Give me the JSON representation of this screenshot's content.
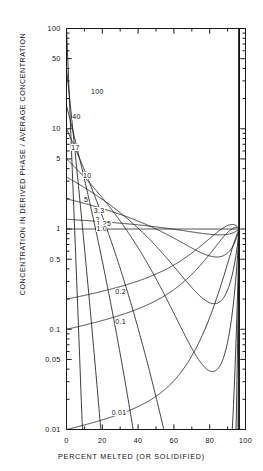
{
  "chart_data": {
    "type": "line",
    "title": "",
    "xlabel": "PERCENT MELTED (OR SOLIDIFIED)",
    "ylabel": "CONCENTRATION IN DERIVED PHASE / AVERAGE CONCENTRATION",
    "xscale": "linear",
    "yscale": "log",
    "xlim": [
      0,
      100
    ],
    "ylim": [
      0.01,
      100
    ],
    "grid": false,
    "legend": "inline-curve-labels",
    "xticks": [
      0,
      20,
      40,
      60,
      80,
      100
    ],
    "xtick_labels": [
      "0",
      "20",
      "40",
      "60",
      "80",
      "100"
    ],
    "x_minor_ticks": [
      10,
      30,
      50,
      70,
      90
    ],
    "yticks": [
      100,
      50,
      10,
      5,
      1,
      0.5,
      0.1,
      0.05,
      0.01
    ],
    "ytick_labels": [
      "100",
      "50",
      "10",
      "5",
      "1",
      "0.5",
      "0.1",
      "0.05",
      "0.01"
    ],
    "series": [
      {
        "name": "100",
        "k": 100,
        "label": "100",
        "label_x": 13.5,
        "label_y": 23.0
      },
      {
        "name": "40",
        "k": 40,
        "label": "40",
        "label_x": 3.0,
        "label_y": 13.0
      },
      {
        "name": "17",
        "k": 17,
        "label": "17",
        "label_x": 2.5,
        "label_y": 6.4
      },
      {
        "name": "10",
        "k": 10,
        "label": "10",
        "label_x": 9.0,
        "label_y": 3.4
      },
      {
        "name": "5",
        "k": 5,
        "label": "5",
        "label_x": 9.5,
        "label_y": 1.92
      },
      {
        "name": "3.3",
        "k": 3.3,
        "label": "3.3",
        "label_x": 15.0,
        "label_y": 1.5
      },
      {
        "name": "2",
        "k": 2,
        "label": "2",
        "label_x": 16.0,
        "label_y": 1.215
      },
      {
        "name": "1.25",
        "k": 1.25,
        "label": "1.25",
        "label_x": 16.5,
        "label_y": 1.105
      },
      {
        "name": "1.0",
        "k": 1.0,
        "label": "1.0",
        "label_x": 16.5,
        "label_y": 1.0
      },
      {
        "name": "0.2",
        "k": 0.2,
        "label": "0.2",
        "label_x": 27.0,
        "label_y": 0.235
      },
      {
        "name": "0.1",
        "k": 0.1,
        "label": "0.1",
        "label_x": 27.0,
        "label_y": 0.118
      },
      {
        "name": "0.01",
        "k": 0.01,
        "label": "0.01",
        "label_x": 25.0,
        "label_y": 0.0145
      }
    ],
    "annotations": [
      "Curves are labelled by the bulk distribution coefficient; all curves converge toward unity near 100 percent melted."
    ]
  }
}
